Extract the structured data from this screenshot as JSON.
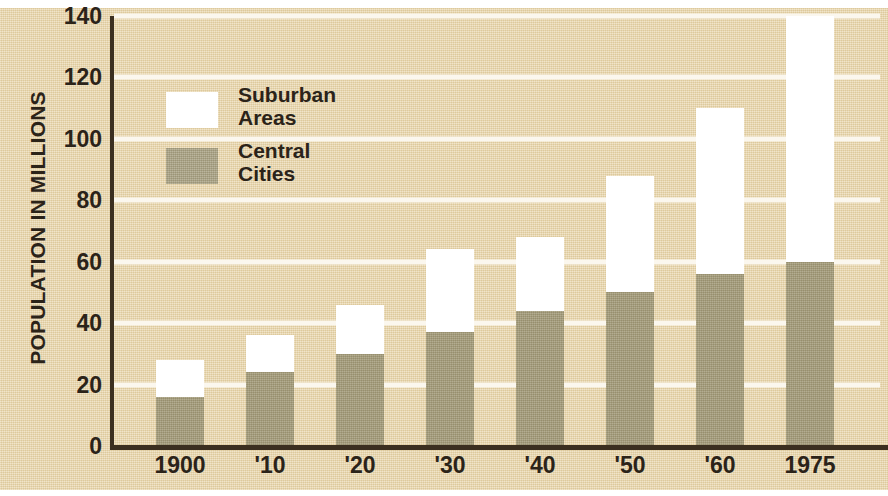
{
  "chart_data": {
    "type": "bar",
    "subtype": "stacked-vertical",
    "title": "",
    "xlabel": "",
    "ylabel": "POPULATION IN MILLIONS",
    "categories": [
      "1900",
      "'10",
      "'20",
      "'30",
      "'40",
      "'50",
      "'60",
      "1975"
    ],
    "series": [
      {
        "name": "Central Cities",
        "values": [
          16,
          24,
          30,
          37,
          44,
          50,
          56,
          60
        ],
        "color": "#a29a78"
      },
      {
        "name": "Suburban Areas",
        "values": [
          12,
          12,
          16,
          27,
          24,
          38,
          54,
          80
        ],
        "color": "#ffffff"
      }
    ],
    "totals": [
      28,
      36,
      46,
      64,
      68,
      88,
      110,
      140
    ],
    "ylim": [
      0,
      140
    ],
    "yticks": [
      0,
      20,
      40,
      60,
      80,
      100,
      120,
      140
    ],
    "ytick_labels": [
      "0",
      "20",
      "40",
      "60",
      "80",
      "100",
      "120",
      "140"
    ],
    "grid": true,
    "grid_color": "#fbf7ee",
    "legend_position": "inside-upper-left",
    "legend": [
      {
        "label_line1": "Suburban",
        "label_line2": "Areas",
        "swatch": "white"
      },
      {
        "label_line1": "Central",
        "label_line2": "Cities",
        "swatch": "gray"
      }
    ],
    "background_color": "#e8d5a9",
    "axis_color": "#3b2f20",
    "text_color": "#2b2319"
  }
}
